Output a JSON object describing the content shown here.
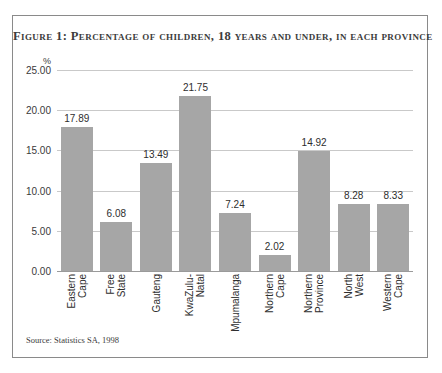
{
  "figure": {
    "title": "Figure 1: Percentage of children, 18 years and under, in each province",
    "source_note": "Source: Statistics SA, 1998",
    "unit_label": "%"
  },
  "chart_data": {
    "type": "bar",
    "title": "Figure 1: Percentage of children, 18 years and under, in each province",
    "xlabel": "",
    "ylabel": "%",
    "ylim": [
      0,
      25
    ],
    "ytick_step": 5,
    "ytick_labels": [
      "25.00",
      "20.00",
      "15.00",
      "10.00",
      "5.00",
      "0.00"
    ],
    "ytick_values": [
      25,
      20,
      15,
      10,
      5,
      0
    ],
    "grid": true,
    "legend": "none",
    "bar_color": "#a6a6a6",
    "categories": [
      "Eastern\nCape",
      "Free\nState",
      "Gauteng",
      "KwaZulu-\nNatal",
      "Mpumalanga",
      "Northern\nCape",
      "Northern\nProvince",
      "North\nWest",
      "Western\nCape"
    ],
    "values": [
      17.89,
      6.08,
      13.49,
      21.75,
      7.24,
      2.02,
      14.92,
      8.28,
      8.33
    ],
    "value_labels": [
      "17.89",
      "6.08",
      "13.49",
      "21.75",
      "7.24",
      "2.02",
      "14.92",
      "8.28",
      "8.33"
    ]
  }
}
